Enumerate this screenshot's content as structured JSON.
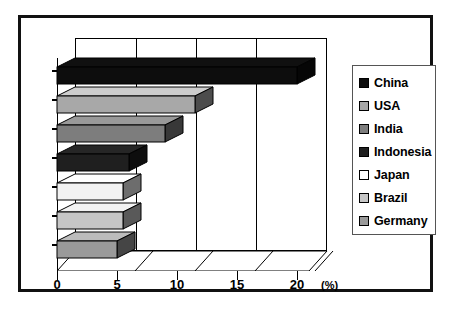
{
  "chart_data": {
    "type": "bar",
    "orientation": "horizontal",
    "title": "",
    "subtitle": "",
    "xlabel": "(%)",
    "ylabel": "",
    "xlim": [
      0,
      21.5
    ],
    "xticks": [
      0,
      5,
      10,
      15,
      20
    ],
    "xticklabels": [
      "0",
      "5",
      "10",
      "15",
      "20"
    ],
    "grid": true,
    "grid_axis": "x",
    "legend_position": "right",
    "style": "3d-bar",
    "categories": [
      "China",
      "USA",
      "India",
      "Indonesia",
      "Japan",
      "Brazil",
      "Germany"
    ],
    "values": [
      20.0,
      11.5,
      9.0,
      6.0,
      5.5,
      5.5,
      5.0
    ],
    "series": [
      {
        "name": "Share",
        "values": [
          20.0,
          11.5,
          9.0,
          6.0,
          5.5,
          5.5,
          5.0
        ]
      }
    ],
    "points": [
      {
        "label": "China",
        "value": 20.0,
        "color": "#0d0d0d"
      },
      {
        "label": "USA",
        "value": 11.5,
        "color": "#a8a8a8"
      },
      {
        "label": "India",
        "value": 9.0,
        "color": "#7d7d7d"
      },
      {
        "label": "Indonesia",
        "value": 6.0,
        "color": "#1f1f1f"
      },
      {
        "label": "Japan",
        "value": 5.5,
        "color": "#f2f2f2"
      },
      {
        "label": "Brazil",
        "value": 5.5,
        "color": "#c6c6c6"
      },
      {
        "label": "Germany",
        "value": 5.0,
        "color": "#9a9a9a"
      }
    ]
  },
  "axis": {
    "unit_label": "(%)",
    "tick_0": "0",
    "tick_5": "5",
    "tick_10": "10",
    "tick_15": "15",
    "tick_20": "20"
  },
  "legend": {
    "items": [
      {
        "label": "China",
        "swatch": "#0d0d0d"
      },
      {
        "label": "USA",
        "swatch": "#a8a8a8"
      },
      {
        "label": "India",
        "swatch": "#7d7d7d"
      },
      {
        "label": "Indonesia",
        "swatch": "#1f1f1f"
      },
      {
        "label": "Japan",
        "swatch": "#ffffff"
      },
      {
        "label": "Brazil",
        "swatch": "#c6c6c6"
      },
      {
        "label": "Germany",
        "swatch": "#9a9a9a"
      }
    ]
  },
  "colors": {
    "frame": "#111111",
    "background": "#ffffff",
    "axis": "#000000",
    "legend_border": "#555555"
  }
}
